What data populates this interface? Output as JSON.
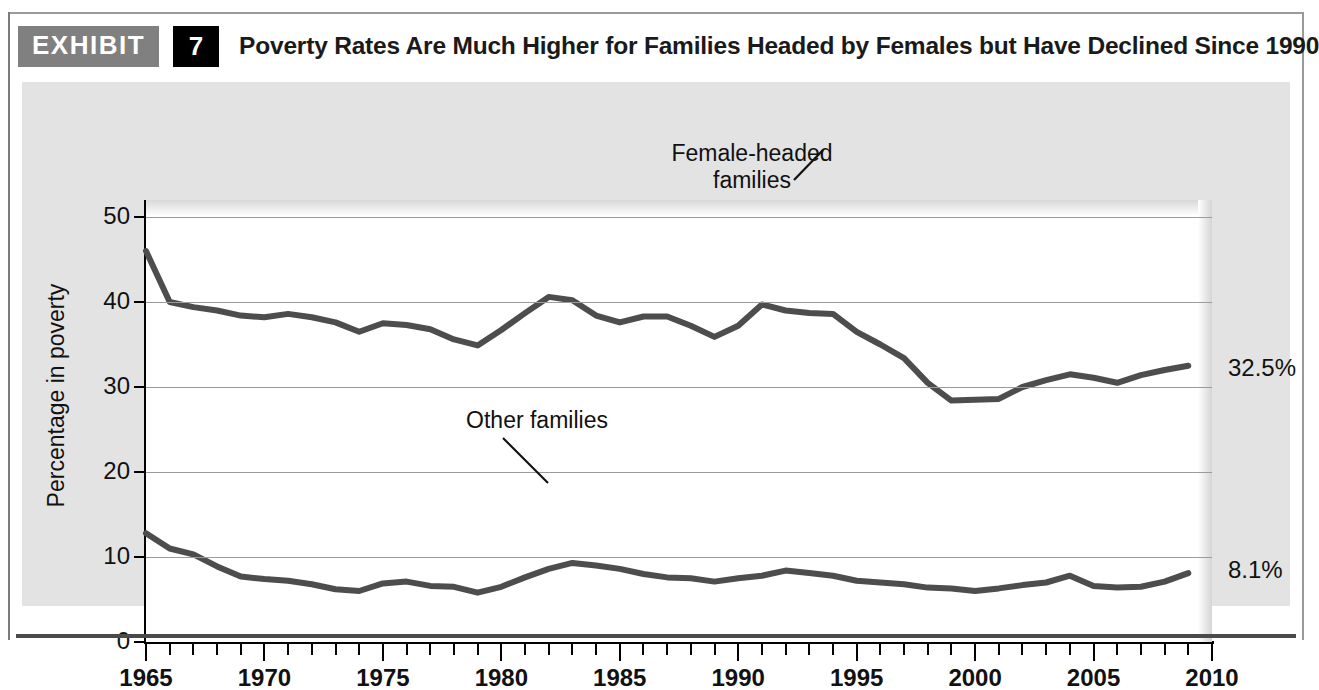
{
  "header": {
    "exhibit_label": "EXHIBIT",
    "exhibit_number": "7",
    "title": "Poverty Rates Are Much Higher for Families Headed by Females but Have Declined Since 1990"
  },
  "right_annotations": {
    "female_value": "32.5%",
    "other_value": "8.1%"
  },
  "series_labels": {
    "female_line1": "Female-headed",
    "female_line2": "families",
    "other": "Other families"
  },
  "chart_data": {
    "type": "line",
    "title": "Poverty Rates Are Much Higher for Families Headed by Females but Have Declined Since 1990",
    "xlabel": "",
    "ylabel": "Percentage in poverty",
    "xlim": [
      1965,
      2010
    ],
    "ylim": [
      0,
      52
    ],
    "yticks": [
      0,
      10,
      20,
      30,
      40,
      50
    ],
    "ytick_labels": [
      "0",
      "10",
      "20",
      "30",
      "40",
      "50"
    ],
    "xticks": [
      1965,
      1970,
      1975,
      1980,
      1985,
      1990,
      1995,
      2000,
      2005,
      2010
    ],
    "xtick_labels": [
      "1965",
      "1970",
      "1975",
      "1980",
      "1985",
      "1990",
      "1995",
      "2000",
      "2005",
      "2010"
    ],
    "xtick_minor_step": 1,
    "grid": true,
    "grid_axis": "y",
    "legend": "inline-annotations",
    "line_color": "#4d4d4d",
    "x": [
      1965,
      1966,
      1967,
      1968,
      1969,
      1970,
      1971,
      1972,
      1973,
      1974,
      1975,
      1976,
      1977,
      1978,
      1979,
      1980,
      1981,
      1982,
      1983,
      1984,
      1985,
      1986,
      1987,
      1988,
      1989,
      1990,
      1991,
      1992,
      1993,
      1994,
      1995,
      1996,
      1997,
      1998,
      1999,
      2000,
      2001,
      2002,
      2003,
      2004,
      2005,
      2006,
      2007,
      2008,
      2009
    ],
    "series": [
      {
        "name": "Female-headed families",
        "values": [
          46.0,
          40.0,
          39.4,
          39.0,
          38.4,
          38.2,
          38.6,
          38.2,
          37.6,
          36.5,
          37.5,
          37.3,
          36.8,
          35.6,
          34.9,
          36.7,
          38.7,
          40.6,
          40.2,
          38.4,
          37.6,
          38.3,
          38.3,
          37.2,
          35.9,
          37.2,
          39.7,
          39.0,
          38.7,
          38.6,
          36.5,
          35.0,
          33.4,
          30.5,
          28.4,
          28.5,
          28.6,
          30.0,
          30.8,
          31.5,
          31.1,
          30.5,
          31.4,
          32.0,
          32.5
        ]
      },
      {
        "name": "Other families",
        "values": [
          12.8,
          11.0,
          10.3,
          8.9,
          7.7,
          7.4,
          7.2,
          6.8,
          6.2,
          6.0,
          6.9,
          7.1,
          6.6,
          6.5,
          5.8,
          6.5,
          7.6,
          8.6,
          9.3,
          9.0,
          8.6,
          8.0,
          7.6,
          7.5,
          7.1,
          7.5,
          7.8,
          8.4,
          8.1,
          7.8,
          7.2,
          7.0,
          6.8,
          6.4,
          6.3,
          6.0,
          6.3,
          6.7,
          7.0,
          7.8,
          6.6,
          6.4,
          6.5,
          7.1,
          8.1
        ]
      }
    ],
    "annotations": [
      {
        "text": "Female-headed families",
        "x": 1991,
        "y": 39.7
      },
      {
        "text": "Other families",
        "x": 1983,
        "y": 9.3
      },
      {
        "text": "32.5%",
        "x": 2010,
        "y": 32.5
      },
      {
        "text": "8.1%",
        "x": 2010,
        "y": 8.1
      }
    ]
  }
}
